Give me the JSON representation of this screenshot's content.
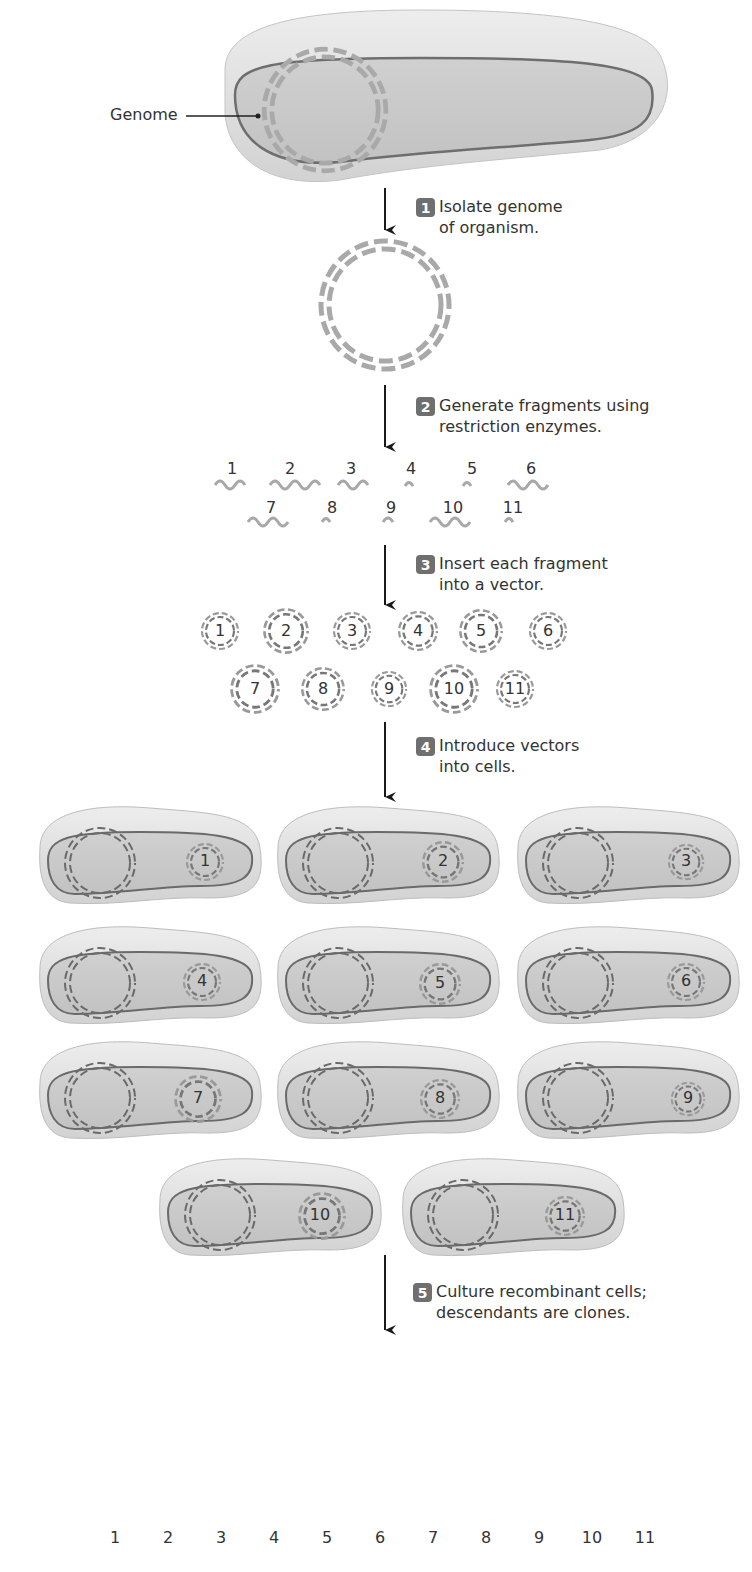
{
  "diagram": {
    "title_label": "Genome",
    "steps": [
      {
        "number": "1",
        "line1": "Isolate genome",
        "line2": "of organism."
      },
      {
        "number": "2",
        "line1": "Generate fragments using",
        "line2": "restriction enzymes."
      },
      {
        "number": "3",
        "line1": "Insert each fragment",
        "line2": "into a vector."
      },
      {
        "number": "4",
        "line1": "Introduce vectors",
        "line2": "into cells."
      },
      {
        "number": "5",
        "line1": "Culture recombinant cells;",
        "line2": "descendants are clones."
      }
    ],
    "fragments": [
      "1",
      "2",
      "3",
      "4",
      "5",
      "6",
      "7",
      "8",
      "9",
      "10",
      "11"
    ],
    "vectors": [
      "1",
      "2",
      "3",
      "4",
      "5",
      "6",
      "7",
      "8",
      "9",
      "10",
      "11"
    ],
    "cells": [
      "1",
      "2",
      "3",
      "4",
      "5",
      "6",
      "7",
      "8",
      "9",
      "10",
      "11"
    ],
    "tubes": [
      "1",
      "2",
      "3",
      "4",
      "5",
      "6",
      "7",
      "8",
      "9",
      "10",
      "11"
    ],
    "colors": {
      "badge": "#6f6f6f",
      "cell_fill": "#cfcfcf",
      "cell_membrane": "#6a6a6a",
      "dna_light": "#a8a8a8",
      "dna_dark": "#6a6a6a",
      "arrow": "#1a1a1a"
    }
  }
}
